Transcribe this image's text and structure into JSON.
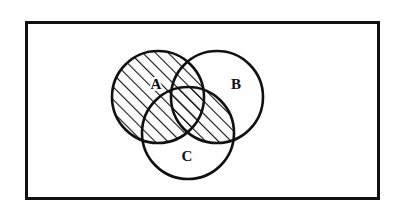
{
  "figure": {
    "type": "venn-diagram",
    "caption": "",
    "background_color": "#fefefe",
    "ink_color": "#111111",
    "universe": {
      "shape": "rectangle",
      "x": 26,
      "y": 22,
      "width": 352,
      "height": 176,
      "border_color": "#111111",
      "border_width": 3,
      "fill": "#fefefe"
    },
    "sets": [
      {
        "id": "A",
        "label": "A",
        "cx": 158,
        "cy": 97,
        "r": 46,
        "label_x": 156,
        "label_y": 86,
        "stroke": "#111111",
        "stroke_width": 2.6,
        "fill": "none",
        "shaded": true
      },
      {
        "id": "B",
        "label": "B",
        "cx": 217,
        "cy": 97,
        "r": 46,
        "label_x": 236,
        "label_y": 86,
        "stroke": "#111111",
        "stroke_width": 2.6,
        "fill": "none",
        "shaded": false
      },
      {
        "id": "C",
        "label": "C",
        "cx": 188,
        "cy": 133,
        "r": 46,
        "label_x": 187,
        "label_y": 158,
        "stroke": "#111111",
        "stroke_width": 2.6,
        "fill": "none",
        "shaded": false
      }
    ],
    "shading": {
      "style": "diagonal-hatch",
      "angle_degrees": 45,
      "line_spacing": 9,
      "line_width": 2.2,
      "line_color": "#111111",
      "shaded_regions": [
        "A",
        "A-intersect-B",
        "A-intersect-C",
        "A-intersect-B-intersect-C",
        "B-intersect-C"
      ],
      "unshaded_regions": [
        "B-only",
        "C-only",
        "outside-all-sets"
      ],
      "set_expression": "A ∪ (B ∩ C)"
    }
  }
}
